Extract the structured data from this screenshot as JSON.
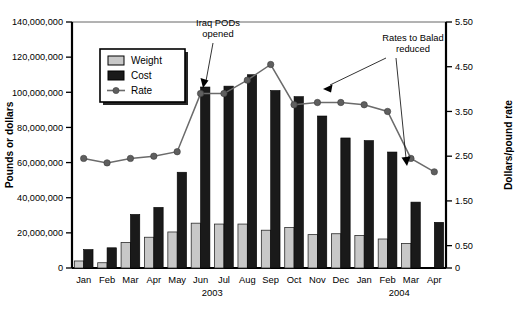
{
  "chart_data": {
    "type": "bar",
    "title": "",
    "subtitle": "",
    "xlabel": "",
    "ylabel": "Pounds or dollars",
    "y2label": "Dollars/pound rate",
    "ylim": [
      0,
      140000000
    ],
    "y2lim": [
      0,
      5.5
    ],
    "grid": false,
    "legend_position": "upper-left-inside",
    "categories": [
      "Jan",
      "Feb",
      "Mar",
      "Apr",
      "May",
      "Jun",
      "Jul",
      "Aug",
      "Sep",
      "Oct",
      "Nov",
      "Dec",
      "Jan",
      "Feb",
      "Mar",
      "Apr"
    ],
    "group_labels": [
      {
        "label": "2003",
        "start_index": 0,
        "end_index": 11
      },
      {
        "label": "2004",
        "start_index": 12,
        "end_index": 15
      }
    ],
    "y_ticks": [
      "0",
      "20,000,000",
      "40,000,000",
      "60,000,000",
      "80,000,000",
      "100,000,000",
      "120,000,000",
      "140,000,000"
    ],
    "y_tick_values": [
      0,
      20000000,
      40000000,
      60000000,
      80000000,
      100000000,
      120000000,
      140000000
    ],
    "y2_ticks": [
      "0",
      "0.50",
      "1.50",
      "2.50",
      "3.50",
      "4.50",
      "5.50"
    ],
    "y2_tick_values": [
      0,
      0.5,
      1.5,
      2.5,
      3.5,
      4.5,
      5.5
    ],
    "series": [
      {
        "name": "Weight",
        "kind": "bar",
        "axis": "left",
        "color": "#c8c8c8",
        "values": [
          4000000,
          3000000,
          14500000,
          17500000,
          20500000,
          25500000,
          25000000,
          25000000,
          21500000,
          23000000,
          19000000,
          19500000,
          18500000,
          16500000,
          14000000,
          0
        ]
      },
      {
        "name": "Cost",
        "kind": "bar",
        "axis": "left",
        "color": "#1a1a1a",
        "values": [
          10500000,
          11500000,
          30500000,
          34500000,
          54500000,
          103000000,
          103500000,
          110000000,
          101000000,
          97500000,
          86500000,
          74000000,
          72500000,
          66000000,
          37500000,
          26000000
        ]
      },
      {
        "name": "Rate",
        "kind": "line",
        "axis": "right",
        "color": "#6b6b6b",
        "values": [
          2.45,
          2.35,
          2.45,
          2.5,
          2.6,
          3.9,
          3.9,
          4.2,
          4.55,
          3.65,
          3.7,
          3.7,
          3.65,
          3.5,
          2.45,
          2.15
        ]
      }
    ],
    "annotations": [
      {
        "text_lines": [
          "Iraq PODs",
          "opened"
        ],
        "points_to": "Jun 2003 rate point",
        "text_x": 218,
        "text_y": 26
      },
      {
        "text_lines": [
          "Rates to Balad",
          "reduced"
        ],
        "points_to": "Oct 2003 rate point and Mar 2004 rate point",
        "text_x": 413,
        "text_y": 40
      }
    ]
  },
  "legend": {
    "items": [
      {
        "label": "Weight",
        "marker": "filled-square-light"
      },
      {
        "label": "Cost",
        "marker": "filled-square-dark"
      },
      {
        "label": "Rate",
        "marker": "line-with-dot"
      }
    ]
  }
}
